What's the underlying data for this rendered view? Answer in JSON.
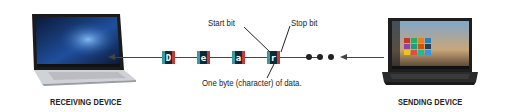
{
  "receiving_device": {
    "caption": "RECEIVING DEVICE"
  },
  "sending_device": {
    "caption": "SENDING DEVICE"
  },
  "stream": {
    "characters": [
      "D",
      "e",
      "a",
      "r"
    ],
    "continuation": "•••"
  },
  "annotations": {
    "start_bit": "Start bit",
    "stop_bit": "Stop bit",
    "byte": "One byte (character) of data."
  },
  "colors": {
    "start_bit": "#3a9aa0",
    "data": "#0e2b33",
    "stop_bit": "#c0393b",
    "line": "#444444"
  }
}
